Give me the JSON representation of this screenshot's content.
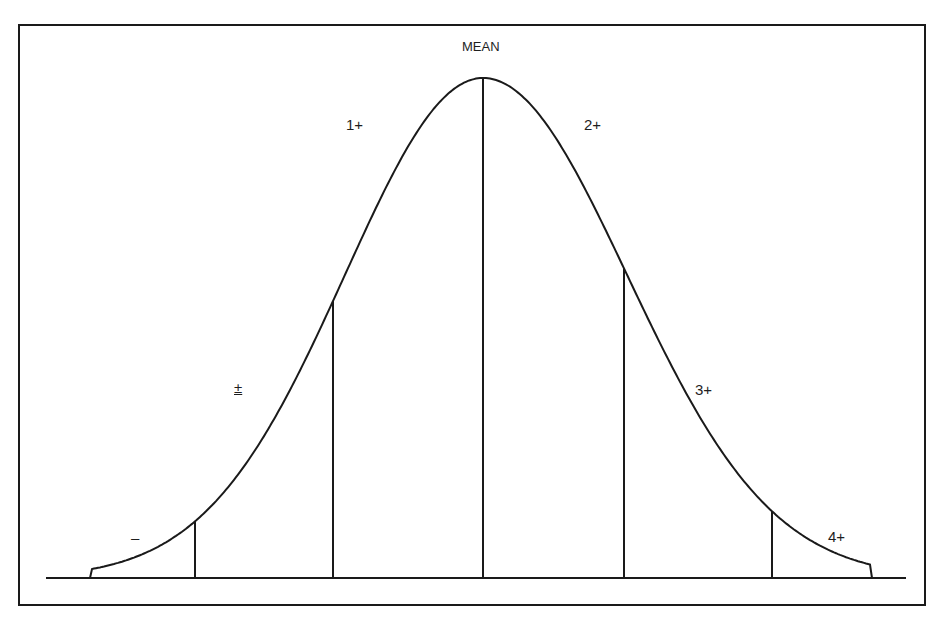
{
  "diagram": {
    "title_label": "MEAN",
    "regions": [
      {
        "id": "neg",
        "label": "–"
      },
      {
        "id": "pm",
        "label": "±"
      },
      {
        "id": "one",
        "label": "1+"
      },
      {
        "id": "two",
        "label": "2+"
      },
      {
        "id": "three",
        "label": "3+"
      },
      {
        "id": "four",
        "label": "4+"
      }
    ],
    "colors": {
      "line": "#1a1a1a",
      "background": "#ffffff",
      "text": "#1e1e1e"
    }
  },
  "chart_data": {
    "type": "line",
    "title": "MEAN",
    "xlabel": "",
    "ylabel": "",
    "curve": "normal distribution",
    "dividers_sd": [
      -2,
      -1,
      0,
      1,
      2
    ],
    "region_labels": [
      "–",
      "±",
      "1+",
      "2+",
      "3+",
      "4+"
    ],
    "grid": false
  }
}
